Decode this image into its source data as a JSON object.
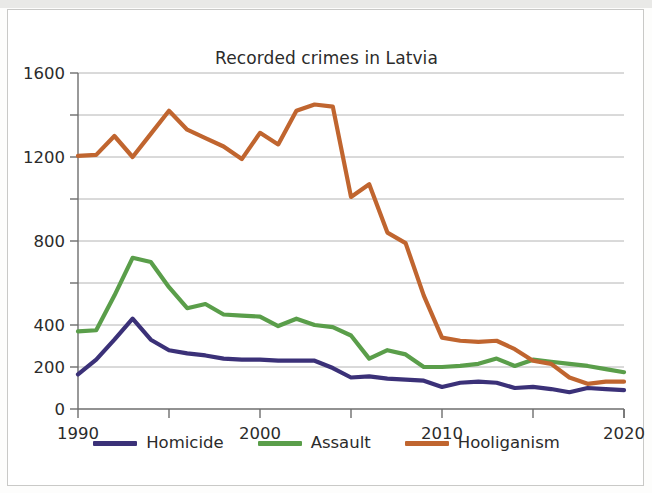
{
  "figure": {
    "title": "Recorded crimes in Latvia",
    "frame_border_color": "#c9c9c7",
    "background_color": "#ffffff"
  },
  "legend": {
    "position": "bottom-center",
    "entries": [
      {
        "label": "Homicide",
        "color": "#3b3178",
        "swatch": "line-swatch"
      },
      {
        "label": "Assault",
        "color": "#5a9e4a",
        "swatch": "line-swatch"
      },
      {
        "label": "Hooliganism",
        "color": "#c0652f",
        "swatch": "line-swatch"
      }
    ]
  },
  "axes": {
    "y_tick_labels": [
      "1600",
      "1200",
      "800",
      "400",
      "200",
      "0"
    ],
    "x_tick_labels": [
      "1990",
      "2000",
      "2010",
      "2020"
    ],
    "y_label": "",
    "x_label": "",
    "grid": "horizontal"
  },
  "chart_data": {
    "type": "line",
    "title": "Recorded crimes in Latvia",
    "xlabel": "",
    "ylabel": "",
    "xlim": [
      1990,
      2020
    ],
    "ylim": [
      0,
      1600
    ],
    "grid": true,
    "grid_orientation": "horizontal",
    "y_gridline_values": [
      200,
      400,
      600,
      800,
      1000,
      1200,
      1400,
      1600
    ],
    "y_labeled_ticks": [
      0,
      200,
      400,
      800,
      1200,
      1600
    ],
    "x_ticks": [
      1990,
      1995,
      2000,
      2005,
      2010,
      2015,
      2020
    ],
    "x_labeled_ticks": [
      1990,
      2000,
      2010,
      2020
    ],
    "legend_position": "bottom-center",
    "x": [
      1990,
      1991,
      1992,
      1993,
      1994,
      1995,
      1996,
      1997,
      1998,
      1999,
      2000,
      2001,
      2002,
      2003,
      2004,
      2005,
      2006,
      2007,
      2008,
      2009,
      2010,
      2011,
      2012,
      2013,
      2014,
      2015,
      2016,
      2017,
      2018,
      2019,
      2020
    ],
    "series": [
      {
        "name": "Homicide",
        "color": "#3b3178",
        "values": [
          165,
          235,
          330,
          430,
          330,
          280,
          265,
          255,
          240,
          235,
          235,
          230,
          230,
          230,
          195,
          150,
          155,
          145,
          140,
          135,
          105,
          125,
          130,
          125,
          100,
          105,
          95,
          80,
          100,
          95,
          90
        ]
      },
      {
        "name": "Assault",
        "color": "#5a9e4a",
        "values": [
          370,
          375,
          540,
          720,
          700,
          580,
          480,
          500,
          450,
          445,
          440,
          395,
          430,
          400,
          390,
          350,
          240,
          280,
          260,
          200,
          200,
          205,
          215,
          240,
          205,
          235,
          225,
          215,
          205,
          190,
          175
        ]
      },
      {
        "name": "Hooliganism",
        "color": "#c0652f",
        "values": [
          1205,
          1210,
          1300,
          1200,
          1310,
          1420,
          1330,
          1290,
          1250,
          1190,
          1315,
          1260,
          1420,
          1450,
          1440,
          1010,
          1070,
          840,
          790,
          540,
          340,
          325,
          320,
          325,
          285,
          230,
          215,
          150,
          120,
          130,
          130
        ]
      }
    ]
  }
}
